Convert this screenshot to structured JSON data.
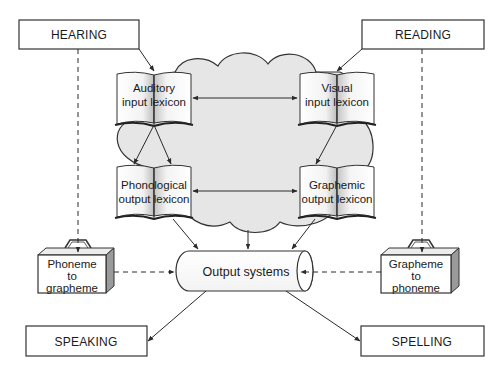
{
  "diagram": {
    "title": "",
    "colors": {
      "line": "#2a2a2a",
      "cloud_fill": "#e6e6e6",
      "box_fill": "#ffffff",
      "book_gradient_light": "#ffffff",
      "book_gradient_dark": "#b8b8b8",
      "case_side": "#9a9a9a"
    },
    "io_boxes": {
      "hearing": "HEARING",
      "reading": "READING",
      "speaking": "SPEAKING",
      "spelling": "SPELLING"
    },
    "lexicons": {
      "auditory_input": {
        "line1": "Auditory",
        "line2": "input lexicon"
      },
      "visual_input": {
        "line1": "Visual",
        "line2": "input lexicon"
      },
      "phonological_output": {
        "line1": "Phonological",
        "line2": "output lexicon"
      },
      "graphemic_output": {
        "line1": "Graphemic",
        "line2": "output lexicon"
      }
    },
    "conversion_routes": {
      "phoneme_to_grapheme": {
        "line1": "Phoneme",
        "line2": "to",
        "line3": "grapheme"
      },
      "grapheme_to_phoneme": {
        "line1": "Grapheme",
        "line2": "to",
        "line3": "phoneme"
      }
    },
    "output_systems": "Output systems",
    "connections": [
      {
        "from": "HEARING",
        "to": "Auditory input lexicon",
        "style": "solid"
      },
      {
        "from": "READING",
        "to": "Visual input lexicon",
        "style": "solid"
      },
      {
        "from": "Auditory input lexicon",
        "to": "Visual input lexicon",
        "style": "solid-bidirectional"
      },
      {
        "from": "Phonological output lexicon",
        "to": "Graphemic output lexicon",
        "style": "solid-bidirectional"
      },
      {
        "from": "Auditory input lexicon",
        "to": "Phonological output lexicon",
        "style": "solid",
        "count": 2
      },
      {
        "from": "Visual input lexicon",
        "to": "Graphemic output lexicon",
        "style": "solid"
      },
      {
        "from": "Phonological output lexicon",
        "to": "Output systems",
        "style": "solid"
      },
      {
        "from": "Cognitive system",
        "to": "Output systems",
        "style": "solid"
      },
      {
        "from": "Graphemic output lexicon",
        "to": "Output systems",
        "style": "solid"
      },
      {
        "from": "HEARING",
        "to": "Phoneme to grapheme",
        "style": "dashed"
      },
      {
        "from": "READING",
        "to": "Grapheme to phoneme",
        "style": "dashed"
      },
      {
        "from": "Phoneme to grapheme",
        "to": "Output systems",
        "style": "dashed"
      },
      {
        "from": "Grapheme to phoneme",
        "to": "Output systems",
        "style": "dashed"
      },
      {
        "from": "Output systems",
        "to": "SPEAKING",
        "style": "solid"
      },
      {
        "from": "Output systems",
        "to": "SPELLING",
        "style": "solid"
      }
    ]
  }
}
